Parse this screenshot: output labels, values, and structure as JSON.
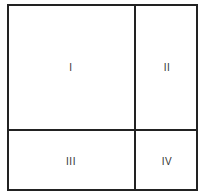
{
  "diagram": {
    "type": "quadrant-grid",
    "border_color": "#222222",
    "cells": [
      {
        "id": "I",
        "label": "I"
      },
      {
        "id": "II",
        "label": "II"
      },
      {
        "id": "III",
        "label": "III"
      },
      {
        "id": "IV",
        "label": "IV"
      }
    ]
  }
}
